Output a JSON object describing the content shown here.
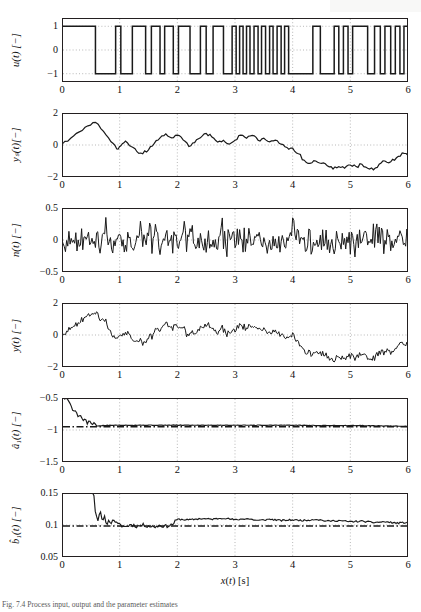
{
  "figure": {
    "x_axis_label": "x(t) [s]",
    "x_ticks": [
      "0",
      "1",
      "2",
      "3",
      "4",
      "5",
      "6"
    ],
    "xlim": [
      0,
      6
    ],
    "caption": "Fig. 7.4  Process input, output and the parameter estimates"
  },
  "panels": [
    {
      "id": "u",
      "ylabel": "u(t) [−]",
      "y_ticks": [
        "1",
        "0",
        "−1"
      ],
      "ylim": [
        -1.35,
        1.35
      ],
      "tick_values": [
        1,
        0,
        -1
      ]
    },
    {
      "id": "ys",
      "ylabel": "yₛ(t)[−]",
      "y_ticks": [
        "2",
        "0",
        "−2"
      ],
      "ylim": [
        -2,
        2
      ],
      "tick_values": [
        2,
        0,
        -2
      ]
    },
    {
      "id": "n",
      "ylabel": "n(t) [−]",
      "y_ticks": [
        "0.5",
        "0",
        "−0.5"
      ],
      "ylim": [
        -0.5,
        0.5
      ],
      "tick_values": [
        0.5,
        0,
        -0.5
      ]
    },
    {
      "id": "y",
      "ylabel": "y(t) [−]",
      "y_ticks": [
        "2",
        "0",
        "−2"
      ],
      "ylim": [
        -2,
        2
      ],
      "tick_values": [
        2,
        0,
        -2
      ]
    },
    {
      "id": "a1",
      "ylabel": "â₁(t) [−]",
      "y_ticks": [
        "−0.5",
        "−1",
        "−1.5"
      ],
      "ylim": [
        -1.5,
        -0.5
      ],
      "tick_values": [
        -0.5,
        -1,
        -1.5
      ]
    },
    {
      "id": "b1",
      "ylabel": "b̂₁(t) [−]",
      "y_ticks": [
        "0.15",
        "0.1",
        "0.05"
      ],
      "ylim": [
        0.05,
        0.15
      ],
      "tick_values": [
        0.15,
        0.1,
        0.05
      ]
    }
  ],
  "chart_data": [
    {
      "type": "line",
      "id": "u",
      "title": "",
      "xlabel": "x(t) [s]",
      "ylabel": "u(t) [−]",
      "xlim": [
        0,
        6
      ],
      "ylim": [
        -1.35,
        1.35
      ],
      "grid": true,
      "signal": "PRBS binary excitation, levels +1 / −1",
      "switch_times": [
        0.58,
        0.93,
        1.02,
        1.22,
        1.45,
        1.55,
        1.7,
        1.78,
        1.93,
        2.02,
        2.22,
        2.4,
        2.5,
        2.62,
        2.8,
        2.95,
        3.02,
        3.08,
        3.14,
        3.2,
        3.26,
        3.33,
        3.4,
        3.46,
        3.53,
        3.6,
        3.66,
        3.73,
        3.8,
        3.86,
        3.93,
        4.35,
        4.48,
        4.72,
        4.8,
        4.88,
        4.96,
        5.04,
        5.3,
        5.42,
        5.52,
        5.6,
        5.7,
        5.78,
        5.86,
        5.93
      ],
      "initial_value": 1
    },
    {
      "type": "line",
      "id": "ys",
      "title": "",
      "xlabel": "x(t) [s]",
      "ylabel": "yₛ(t)[−]",
      "xlim": [
        0,
        6
      ],
      "ylim": [
        -2,
        2
      ],
      "grid": true,
      "description": "Noise-free process output, piecewise-linear ramps driven by PRBS input",
      "x": [
        0,
        0.15,
        0.3,
        0.45,
        0.58,
        0.72,
        0.85,
        0.95,
        1.02,
        1.1,
        1.2,
        1.3,
        1.4,
        1.5,
        1.6,
        1.7,
        1.8,
        1.9,
        2.0,
        2.1,
        2.2,
        2.3,
        2.4,
        2.5,
        2.6,
        2.7,
        2.8,
        2.9,
        3.0,
        3.1,
        3.2,
        3.3,
        3.4,
        3.5,
        3.6,
        3.7,
        3.8,
        3.9,
        4.0,
        4.1,
        4.2,
        4.3,
        4.4,
        4.5,
        4.6,
        4.7,
        4.8,
        4.9,
        5.0,
        5.1,
        5.2,
        5.3,
        5.4,
        5.5,
        5.6,
        5.7,
        5.8,
        5.9,
        6.0
      ],
      "y": [
        0.05,
        0.42,
        0.82,
        1.2,
        1.42,
        0.85,
        0.2,
        -0.25,
        -0.05,
        0.25,
        -0.1,
        -0.42,
        -0.55,
        -0.3,
        0.1,
        0.45,
        0.7,
        0.45,
        0.62,
        0.32,
        -0.1,
        0.15,
        0.45,
        0.72,
        0.5,
        0.18,
        0.3,
        0.05,
        0.3,
        0.62,
        0.42,
        0.6,
        0.3,
        0.42,
        0.2,
        0.3,
        0.05,
        -0.15,
        -0.2,
        -0.55,
        -0.95,
        -1.15,
        -1.0,
        -1.15,
        -1.3,
        -1.5,
        -1.35,
        -1.45,
        -1.25,
        -1.35,
        -1.2,
        -1.45,
        -1.55,
        -1.2,
        -1.0,
        -1.05,
        -0.8,
        -0.5,
        -0.65
      ]
    },
    {
      "type": "line",
      "id": "n",
      "title": "",
      "xlabel": "x(t) [s]",
      "ylabel": "n(t) [−]",
      "xlim": [
        0,
        6
      ],
      "ylim": [
        -0.5,
        0.5
      ],
      "grid": true,
      "description": "Zero-mean white measurement noise, amplitude roughly ±0.3",
      "noise_std": 0.12,
      "samples_per_second": 50
    },
    {
      "type": "line",
      "id": "y",
      "title": "",
      "xlabel": "x(t) [s]",
      "ylabel": "y(t) [−]",
      "xlim": [
        0,
        6
      ],
      "ylim": [
        -2,
        2
      ],
      "grid": true,
      "description": "Measured output y(t) = yₛ(t) + n(t)"
    },
    {
      "type": "line",
      "id": "a1",
      "title": "",
      "xlabel": "x(t) [s]",
      "ylabel": "â₁(t) [−]",
      "xlim": [
        0,
        6
      ],
      "ylim": [
        -1.5,
        -0.5
      ],
      "grid": true,
      "description": "Recursive estimate of parameter a₁ converging to its true value",
      "reference_value": -0.95,
      "reference_style": "dash-dot",
      "converged_value": -0.93,
      "x": [
        0,
        0.1,
        0.16,
        0.2,
        0.24,
        0.28,
        0.32,
        0.36,
        0.4,
        0.44,
        0.48,
        0.52,
        0.56,
        0.6,
        0.7,
        0.9,
        1.2,
        1.6,
        2.0,
        2.5,
        3.0,
        3.5,
        4.0,
        4.5,
        5.0,
        5.5,
        6.0
      ],
      "y": [
        -0.5,
        -0.52,
        -0.62,
        -0.72,
        -0.68,
        -0.8,
        -0.76,
        -0.86,
        -0.82,
        -0.9,
        -0.85,
        -0.93,
        -0.88,
        -0.94,
        -0.93,
        -0.925,
        -0.925,
        -0.925,
        -0.925,
        -0.925,
        -0.925,
        -0.925,
        -0.925,
        -0.93,
        -0.93,
        -0.935,
        -0.94
      ]
    },
    {
      "type": "line",
      "id": "b1",
      "title": "",
      "xlabel": "x(t) [s]",
      "ylabel": "b̂₁(t) [−]",
      "xlim": [
        0,
        6
      ],
      "ylim": [
        0.05,
        0.15
      ],
      "grid": true,
      "description": "Recursive estimate of parameter b₁ converging to its true value",
      "reference_value": 0.0985,
      "reference_style": "dash-dot",
      "converged_value": 0.106,
      "x": [
        0,
        0.55,
        0.58,
        0.62,
        0.66,
        0.7,
        0.74,
        0.78,
        0.82,
        0.86,
        0.9,
        0.95,
        1.0,
        1.1,
        1.2,
        1.3,
        1.4,
        1.5,
        1.6,
        1.7,
        1.8,
        1.9,
        1.95,
        2.0,
        2.2,
        2.4,
        2.6,
        2.8,
        3.0,
        3.2,
        3.4,
        3.6,
        3.8,
        4.0,
        4.2,
        4.4,
        4.6,
        4.8,
        5.0,
        5.2,
        5.4,
        5.6,
        5.8,
        6.0
      ],
      "y": [
        0.15,
        0.15,
        0.118,
        0.108,
        0.122,
        0.104,
        0.112,
        0.101,
        0.108,
        0.103,
        0.109,
        0.102,
        0.1,
        0.097,
        0.101,
        0.098,
        0.1,
        0.0985,
        0.097,
        0.0995,
        0.098,
        0.1,
        0.104,
        0.109,
        0.108,
        0.11,
        0.109,
        0.111,
        0.108,
        0.11,
        0.107,
        0.109,
        0.107,
        0.108,
        0.107,
        0.109,
        0.106,
        0.107,
        0.105,
        0.106,
        0.104,
        0.105,
        0.103,
        0.104
      ]
    }
  ]
}
